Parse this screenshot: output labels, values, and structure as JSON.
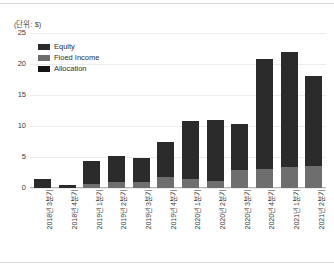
{
  "unit_caption": "(단위: $)",
  "legend": {
    "position": "inside-top-left",
    "items": [
      {
        "label": "Equity",
        "color": "#2b2b2b",
        "swatch_name": "legend-swatch-equity"
      },
      {
        "label": "Fioed Income",
        "color": "#6e6e6e",
        "swatch_name": "legend-swatch-fixed-income"
      },
      {
        "label": "Allocation",
        "color": "#141414",
        "swatch_name": "legend-swatch-allocation"
      }
    ]
  },
  "chart_data": {
    "type": "bar",
    "title": "",
    "subtitle": "",
    "xlabel": "",
    "ylabel": "",
    "unit": "(단위: $)",
    "stacked": true,
    "grid": true,
    "legend_position": "inside-top-left",
    "ylim": [
      0,
      25
    ],
    "yticks": [
      0,
      5,
      10,
      15,
      20,
      25
    ],
    "ytick_labels": [
      "0",
      "5",
      "10",
      "15",
      "20",
      "25"
    ],
    "categories": [
      "2018년 3분기",
      "2018년 4분기",
      "2019년 1분기",
      "2019년 2분기",
      "2019년 3분기",
      "2019년 4분기",
      "2020년 1분기",
      "2020년 2분기",
      "2020년 3분기",
      "2020년 4분기",
      "2021년 1분기",
      "2021년 2분기"
    ],
    "series": [
      {
        "name": "Fioed Income",
        "color": "#6e6e6e",
        "values": [
          0.0,
          0.0,
          0.7,
          1.0,
          0.9,
          1.7,
          1.5,
          1.1,
          2.9,
          3.1,
          3.4,
          3.6
        ]
      },
      {
        "name": "Equity",
        "color": "#2b2b2b",
        "values": [
          1.5,
          0.5,
          3.6,
          4.1,
          4.0,
          5.7,
          9.3,
          9.8,
          7.4,
          17.7,
          18.6,
          14.4
        ]
      },
      {
        "name": "Allocation",
        "color": "#141414",
        "values": [
          0.0,
          0.0,
          0.0,
          0.0,
          0.0,
          0.0,
          0.0,
          0.0,
          0.0,
          0.0,
          0.0,
          0.0
        ]
      }
    ],
    "totals": [
      1.5,
      0.5,
      4.3,
      5.1,
      4.9,
      7.4,
      10.8,
      10.9,
      10.3,
      20.8,
      22.0,
      18.0
    ]
  }
}
